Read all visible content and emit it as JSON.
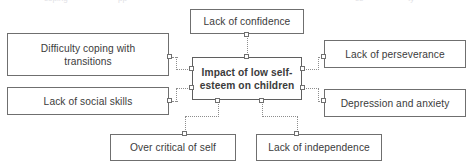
{
  "diagram": {
    "type": "mind-map",
    "center": {
      "label": "Impact of low self-\nesteem on children"
    },
    "branches": [
      {
        "id": "lack-of-confidence",
        "label": "Lack of confidence",
        "position": "top"
      },
      {
        "id": "difficulty-coping",
        "label": "Difficulty coping with\ntransitions",
        "position": "left-upper"
      },
      {
        "id": "lack-of-social-skills",
        "label": "Lack of social skills",
        "position": "left-lower"
      },
      {
        "id": "lack-of-perseverance",
        "label": "Lack of perseverance",
        "position": "right-upper"
      },
      {
        "id": "depression-anxiety",
        "label": "Depression and anxiety",
        "position": "right-lower"
      },
      {
        "id": "over-critical-of-self",
        "label": "Over critical of self",
        "position": "bottom-left"
      },
      {
        "id": "lack-of-independence",
        "label": "Lack of independence",
        "position": "bottom-right"
      }
    ],
    "colors": {
      "box_border": "#6f6f6f",
      "center_border": "#5f5f5f",
      "text": "#3b3b3b",
      "connector": "#8d8d8d",
      "background": "#ffffff"
    }
  }
}
